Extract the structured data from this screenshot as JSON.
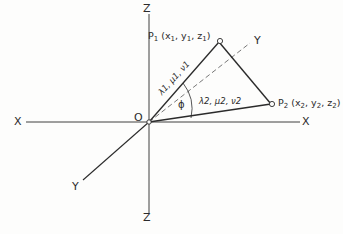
{
  "diagram": {
    "type": "3d-axes-line-pair",
    "stroke_color": "#2b2b2b",
    "background_color": "#fdfdfc",
    "axes": [
      {
        "name": "x-axis-negative",
        "label": "X",
        "x": 14,
        "y": 116
      },
      {
        "name": "x-axis-positive",
        "label": "X",
        "x": 302,
        "y": 116
      },
      {
        "name": "z-axis-positive",
        "label": "Z",
        "x": 143,
        "y": 3
      },
      {
        "name": "z-axis-negative",
        "label": "Z",
        "x": 143,
        "y": 212
      },
      {
        "name": "y-axis-positive",
        "label": "Y",
        "x": 254,
        "y": 35
      },
      {
        "name": "y-axis-negative",
        "label": "Y",
        "x": 72,
        "y": 181
      }
    ],
    "origin": {
      "label": "O",
      "x": 134,
      "y": 112
    },
    "points": [
      {
        "name": "point-p1",
        "label": "P",
        "sub": "1",
        "coords": "(x1, y1, z1)",
        "coords_parts": [
          "x",
          "1",
          ", y",
          "1",
          ", z",
          "1"
        ],
        "label_x": 148,
        "label_y": 31,
        "vertex_x": 220,
        "vertex_y": 41
      },
      {
        "name": "point-p2",
        "label": "P",
        "sub": "2",
        "coords": "(x2, y2, z2)",
        "coords_parts": [
          "x",
          "2",
          ", y",
          "2",
          ", z",
          "2"
        ],
        "label_x": 278,
        "label_y": 98,
        "vertex_x": 272,
        "vertex_y": 104
      }
    ],
    "direction_cosines": [
      {
        "name": "direction-cosines-line-1",
        "label": "λ1, μ1, ν1",
        "symbols": [
          "λ",
          "μ",
          "ν"
        ],
        "subscript": "1",
        "x": 163,
        "y": 88
      },
      {
        "name": "direction-cosines-line-2",
        "label": "λ2, μ2, ν2",
        "symbols": [
          "λ",
          "μ",
          "ν"
        ],
        "subscript": "2",
        "x": 199,
        "y": 97
      }
    ],
    "angle": {
      "name": "angle-phi",
      "label": "ϕ",
      "x": 178,
      "y": 100,
      "between": [
        "line-op1",
        "line-op2"
      ]
    },
    "lines": {
      "solid": [
        "O-P1",
        "P1-P2",
        "O-P2"
      ],
      "dashed": [
        "O-Y-positive-axis"
      ]
    }
  }
}
